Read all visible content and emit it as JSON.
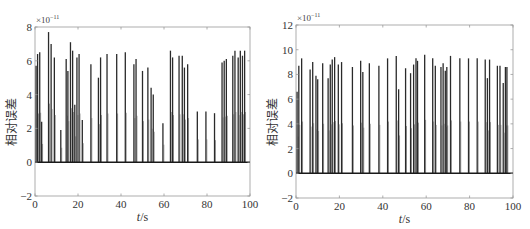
{
  "chart_data": [
    {
      "type": "bar",
      "subtype": "stem/impulse",
      "title": "",
      "xlabel": "t/s",
      "ylabel": "相对误差",
      "y_multiplier": "×10^-11",
      "xlim": [
        0,
        100
      ],
      "ylim": [
        -2,
        8
      ],
      "xticks": [
        0,
        20,
        40,
        60,
        80,
        100
      ],
      "yticks": [
        -2,
        0,
        2,
        4,
        6,
        8
      ],
      "grid": false,
      "legend": null,
      "x": [
        0.5,
        1.2,
        2.2,
        3.1,
        6.3,
        7.5,
        9.0,
        12.0,
        14.5,
        15.3,
        16.5,
        17.5,
        18.5,
        19.5,
        20.5,
        22.0,
        26.0,
        29.5,
        30.5,
        33.5,
        38.0,
        42.0,
        46.0,
        47.0,
        50.0,
        52.5,
        54.0,
        55.0,
        59.5,
        63.0,
        64.0,
        67.0,
        68.5,
        69.5,
        71.0,
        75.5,
        79.5,
        83.5,
        87.0,
        88.0,
        89.0,
        92.0,
        93.0,
        94.5,
        95.5,
        96.5,
        97.5
      ],
      "values": [
        5.7,
        6.4,
        6.5,
        2.4,
        7.7,
        7.0,
        6.2,
        1.9,
        6.1,
        5.4,
        7.1,
        6.6,
        3.4,
        6.2,
        6.4,
        2.5,
        5.8,
        5.0,
        6.2,
        6.4,
        6.4,
        6.5,
        5.8,
        6.1,
        5.4,
        5.6,
        4.4,
        4.0,
        2.3,
        6.6,
        6.2,
        6.3,
        6.3,
        5.6,
        5.8,
        3.0,
        3.0,
        2.9,
        5.9,
        6.0,
        6.1,
        6.3,
        6.6,
        6.2,
        6.6,
        6.3,
        6.6
      ],
      "baseline": 0
    },
    {
      "type": "bar",
      "subtype": "stem/impulse",
      "title": "",
      "xlabel": "t/s",
      "ylabel": "相对误差",
      "y_multiplier": "×10^-11",
      "xlim": [
        0,
        100
      ],
      "ylim": [
        -2,
        12
      ],
      "xticks": [
        0,
        20,
        40,
        60,
        80,
        100
      ],
      "yticks": [
        -2,
        0,
        2,
        4,
        6,
        8,
        10,
        12
      ],
      "grid": false,
      "legend": null,
      "x": [
        0.5,
        1.3,
        2.6,
        6.5,
        7.7,
        9.2,
        10.0,
        12.3,
        14.8,
        15.8,
        16.7,
        17.8,
        19.5,
        21.0,
        26.0,
        29.8,
        30.8,
        33.8,
        38.2,
        42.2,
        46.2,
        47.3,
        50.5,
        52.8,
        54.2,
        55.3,
        56.0,
        59.3,
        63.0,
        64.2,
        66.8,
        67.8,
        68.8,
        69.5,
        71.2,
        75.5,
        79.5,
        83.5,
        87.2,
        88.2,
        89.2,
        92.8,
        94.0,
        95.5,
        96.5,
        97.2
      ],
      "values": [
        6.6,
        8.7,
        9.3,
        8.4,
        9.0,
        7.9,
        7.6,
        8.9,
        7.7,
        8.8,
        9.2,
        9.4,
        8.8,
        9.0,
        8.6,
        9.1,
        8.2,
        8.9,
        8.7,
        9.3,
        9.5,
        6.8,
        8.5,
        8.1,
        8.8,
        9.3,
        9.1,
        9.6,
        9.3,
        8.7,
        8.6,
        8.9,
        8.3,
        8.6,
        9.5,
        9.3,
        9.3,
        9.3,
        9.2,
        7.7,
        9.2,
        8.7,
        8.7,
        7.3,
        8.6,
        8.6
      ],
      "baseline": 0
    }
  ],
  "charts": {
    "left": {
      "ylabel": "相对误差",
      "xlabel_italic": "t",
      "xlabel_rest": "/s",
      "exponent_prefix": "×10",
      "exponent": "−11"
    },
    "right": {
      "ylabel": "相对误差",
      "xlabel_italic": "t",
      "xlabel_rest": "/s",
      "exponent_prefix": "×10",
      "exponent": "−11"
    }
  },
  "colors": {
    "stem": "#2a2a2a",
    "axis": "#9a9a9a",
    "baseline": "#1a1a1a"
  }
}
